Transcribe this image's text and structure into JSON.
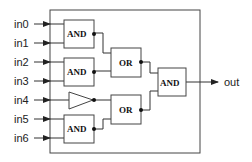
{
  "diagram": {
    "inputs": [
      {
        "label": "in0"
      },
      {
        "label": "in1"
      },
      {
        "label": "in2"
      },
      {
        "label": "in3"
      },
      {
        "label": "in4"
      },
      {
        "label": "in5"
      },
      {
        "label": "in6"
      }
    ],
    "output": {
      "label": "out"
    },
    "gates": [
      {
        "id": "and1",
        "type": "AND",
        "label": "AND"
      },
      {
        "id": "and2",
        "type": "AND",
        "label": "AND"
      },
      {
        "id": "buf1",
        "type": "BUFFER",
        "label": ""
      },
      {
        "id": "and3",
        "type": "AND",
        "label": "AND"
      },
      {
        "id": "or1",
        "type": "OR",
        "label": "OR"
      },
      {
        "id": "or2",
        "type": "OR",
        "label": "OR"
      },
      {
        "id": "and4",
        "type": "AND",
        "label": "AND"
      }
    ],
    "connections": [
      [
        "in0",
        "and1"
      ],
      [
        "in1",
        "and1"
      ],
      [
        "in2",
        "and2"
      ],
      [
        "in3",
        "and2"
      ],
      [
        "in4",
        "buf1"
      ],
      [
        "in5",
        "and3"
      ],
      [
        "in6",
        "and3"
      ],
      [
        "and1",
        "or1"
      ],
      [
        "and2",
        "or1"
      ],
      [
        "buf1",
        "or2"
      ],
      [
        "and3",
        "or2"
      ],
      [
        "or1",
        "and4"
      ],
      [
        "or2",
        "and4"
      ],
      [
        "and4",
        "out"
      ]
    ],
    "colors": {
      "stroke": "#333333",
      "background": "#ffffff"
    }
  }
}
